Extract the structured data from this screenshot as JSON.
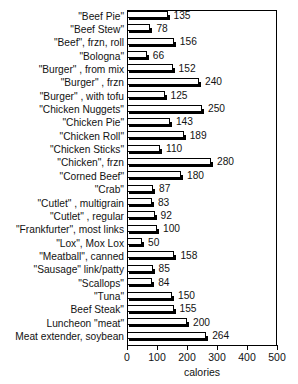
{
  "chart_data": {
    "type": "bar",
    "orientation": "horizontal",
    "title": "",
    "xlabel": "calories",
    "ylabel": "",
    "xlim": [
      0,
      500
    ],
    "ylim": null,
    "grid": false,
    "legend": null,
    "xticks": [
      0,
      100,
      200,
      300,
      400,
      500
    ],
    "xtick_labels": [
      "0",
      "100",
      "200",
      "300",
      "400",
      "500"
    ],
    "categories": [
      "\"Beef Pie\"",
      "\"Beef Stew\"",
      "\"Beef\", frzn, roll",
      "\"Bologna\"",
      "\"Burger\" , from mix",
      "\"Burger\" , frzn",
      "\"Burger\" , with tofu",
      "\"Chicken Nuggets\"",
      "\"Chicken Pie\"",
      "\"Chicken Roll\"",
      "\"Chicken Sticks\"",
      "\"Chicken\", frzn",
      "\"Corned Beef\"",
      "\"Crab\"",
      "\"Cutlet\" , multigrain",
      "\"Cutlet\" , regular",
      "\"Frankfurter\", most links",
      "\"Lox\", Mox Lox",
      "\"Meatball\", canned",
      "\"Sausage\" link/patty",
      "\"Scallops\"",
      "\"Tuna\"",
      "Beef Steak\"",
      "Luncheon \"meat\"",
      "Meat extender, soybean"
    ],
    "values": [
      135,
      78,
      156,
      66,
      152,
      240,
      125,
      250,
      143,
      189,
      110,
      280,
      180,
      87,
      83,
      92,
      100,
      50,
      158,
      85,
      84,
      150,
      155,
      200,
      264
    ],
    "value_labels": [
      "135",
      "78",
      "156",
      "66",
      "152",
      "240",
      "125",
      "250",
      "143",
      "189",
      "110",
      "280",
      "180",
      "87",
      "83",
      "92",
      "100",
      "50",
      "158",
      "85",
      "84",
      "150",
      "155",
      "200",
      "264"
    ],
    "colors": {
      "bar_face": "#ffffff",
      "bar_edge": "#000000",
      "bar_shadow": "#000000",
      "text": "#121212",
      "frame": "#000000"
    }
  }
}
